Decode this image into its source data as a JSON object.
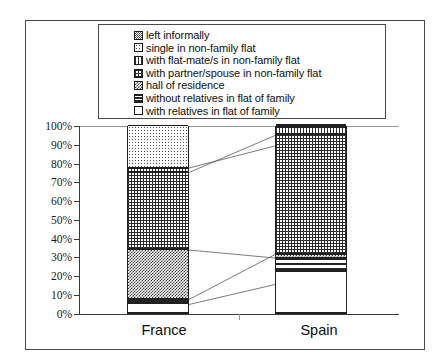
{
  "chart_data": {
    "type": "bar",
    "subtype": "stacked-100-percent",
    "title": "",
    "xlabel": "",
    "ylabel": "",
    "ylim": [
      0,
      100
    ],
    "ytick_labels": [
      "0%",
      "10%",
      "20%",
      "30%",
      "40%",
      "50%",
      "60%",
      "70%",
      "80%",
      "90%",
      "100%"
    ],
    "ytick_values": [
      0,
      10,
      20,
      30,
      40,
      50,
      60,
      70,
      80,
      90,
      100
    ],
    "grid": false,
    "legend_position": "top",
    "categories": [
      "France",
      "Spain"
    ],
    "series": [
      {
        "name": "with relatives in flat of family",
        "pattern": "white",
        "values": [
          5,
          22
        ]
      },
      {
        "name": "without relatives in flat of family",
        "pattern": "horiz",
        "values": [
          2,
          7
        ]
      },
      {
        "name": "hall of  residence",
        "pattern": "checker",
        "values": [
          27,
          2
        ]
      },
      {
        "name": "with partner/spouse in non-family flat",
        "pattern": "grid",
        "values": [
          41,
          64
        ]
      },
      {
        "name": "with flat-mate/s in non-family flat",
        "pattern": "vert",
        "values": [
          2,
          4
        ]
      },
      {
        "name": "single in non-family flat",
        "pattern": "dots",
        "values": [
          23,
          0.6
        ]
      },
      {
        "name": "left informally",
        "pattern": "fine",
        "values": [
          0,
          0.4
        ]
      }
    ]
  },
  "legend": {
    "items": [
      {
        "label": "left informally",
        "pattern": "fine"
      },
      {
        "label": "single in non-family flat",
        "pattern": "dots"
      },
      {
        "label": "with flat-mate/s in non-family flat",
        "pattern": "vert"
      },
      {
        "label": "with partner/spouse in non-family flat",
        "pattern": "grid"
      },
      {
        "label": "hall of  residence",
        "pattern": "checker"
      },
      {
        "label": "without relatives in flat of family",
        "pattern": "horiz"
      },
      {
        "label": "with relatives in flat of family",
        "pattern": "white"
      }
    ]
  },
  "colors": {
    "frame": "#4a4a4a",
    "bar_outline": "#1f1f1f",
    "axis": "#3a3a3a",
    "text": "#111111",
    "background": "#ffffff"
  }
}
